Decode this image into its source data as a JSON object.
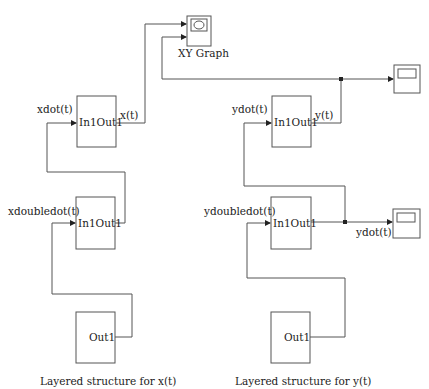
{
  "diagram": {
    "colors": {
      "line": "#555555",
      "text": "#222222",
      "background": "#ffffff"
    },
    "top_title_partial": "",
    "xy_graph": {
      "label": "XY Graph",
      "icon": "xy-graph-icon"
    },
    "left": {
      "caption": "Layered structure for x(t)",
      "blocks": [
        {
          "label": "In1Out1",
          "input_label": "xdot(t)",
          "output_label": "x(t)"
        },
        {
          "label": "In1Out1",
          "input_label": "xdoubledot(t)"
        },
        {
          "label": "Out1"
        }
      ]
    },
    "right": {
      "caption": "Layered structure for y(t)",
      "blocks": [
        {
          "label": "In1Out1",
          "input_label": "ydot(t)",
          "output_label": "y(t)"
        },
        {
          "label": "In1Out1",
          "input_label": "ydoubledot(t)",
          "output_label": "ydot(t)"
        },
        {
          "label": "Out1"
        }
      ],
      "scopes": [
        {
          "name": "scope-y",
          "icon": "scope-icon"
        },
        {
          "name": "scope-ydot",
          "icon": "scope-icon"
        }
      ]
    }
  }
}
